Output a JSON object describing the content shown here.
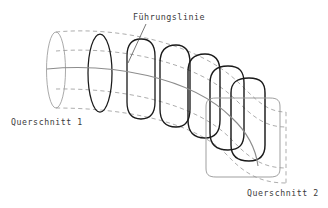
{
  "figure": {
    "kind": "technical-line-drawing",
    "background_color": "#ffffff",
    "width": 328,
    "height": 208
  },
  "labels": {
    "guide_line": "Führungslinie",
    "cross_section_start": "Querschnitt 1",
    "cross_section_end": "Querschnitt 2"
  },
  "colors": {
    "outline_dark": "#1a1a1a",
    "outline_light": "#9a9a9a",
    "guide_line": "#8c8c8c",
    "dashed_envelope": "#8a8a8a",
    "text": "#3a3a3a"
  },
  "geometry": {
    "profile_count": 8,
    "profiles": [
      {
        "index": 1,
        "name": "profile-1-circle",
        "shape": "ellipse",
        "roundness": 1.0,
        "stroke": "light",
        "cx": 56,
        "cy": 70,
        "rx": 9.5,
        "ry": 38
      },
      {
        "index": 2,
        "name": "profile-2",
        "shape": "ellipse",
        "roundness": 1.0,
        "stroke": "dark",
        "cx": 100,
        "cy": 73,
        "rx": 12.0,
        "ry": 39
      },
      {
        "index": 3,
        "name": "profile-3",
        "shape": "rounded",
        "roundness": 0.82,
        "stroke": "dark",
        "cx": 141,
        "cy": 79,
        "rx": 14.0,
        "ry": 40
      },
      {
        "index": 4,
        "name": "profile-4",
        "shape": "rounded",
        "roundness": 0.64,
        "stroke": "dark",
        "cx": 174,
        "cy": 86,
        "rx": 16.0,
        "ry": 41
      },
      {
        "index": 5,
        "name": "profile-5",
        "shape": "rounded",
        "roundness": 0.46,
        "stroke": "dark",
        "cx": 202,
        "cy": 96,
        "rx": 18.0,
        "ry": 42
      },
      {
        "index": 6,
        "name": "profile-6",
        "shape": "rounded",
        "roundness": 0.33,
        "stroke": "dark",
        "cx": 224,
        "cy": 108,
        "rx": 20.0,
        "ry": 43
      },
      {
        "index": 7,
        "name": "profile-7",
        "shape": "rounded",
        "roundness": 0.22,
        "stroke": "dark",
        "cx": 243,
        "cy": 120,
        "rx": 22.0,
        "ry": 44
      },
      {
        "index": 8,
        "name": "profile-8-square",
        "shape": "rounded",
        "roundness": 0.1,
        "stroke": "light",
        "cx": 262,
        "cy": 134,
        "rx": 24.0,
        "ry": 45
      }
    ],
    "guide_curve": "M 47 69 C 110 63, 190 76, 232 118 C 248 133, 256 150, 258 163",
    "leader_line": {
      "from": [
        146,
        24
      ],
      "to": [
        128,
        62
      ]
    }
  },
  "label_positions": {
    "guide_line": {
      "x": 133,
      "y": 20
    },
    "cross_section_start": {
      "x": 11,
      "y": 125
    },
    "cross_section_end": {
      "x": 247,
      "y": 196
    }
  }
}
